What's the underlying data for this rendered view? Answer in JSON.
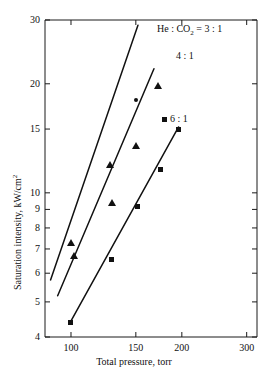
{
  "chart_data": {
    "type": "line",
    "title": "",
    "xlabel": "Total pressure, torr",
    "ylabel": "Saturation intensity, kW/cm²",
    "xscale": "log",
    "yscale": "log",
    "xlim": [
      85,
      320
    ],
    "ylim": [
      4,
      30
    ],
    "grid": false,
    "legend_position": "inline-right-of-lines",
    "xticks": [
      {
        "value": 100,
        "label": "100"
      },
      {
        "value": 150,
        "label": "150"
      },
      {
        "value": 200,
        "label": "200"
      },
      {
        "value": 300,
        "label": "300"
      }
    ],
    "yticks": [
      {
        "value": 4,
        "label": "4"
      },
      {
        "value": 5,
        "label": "5"
      },
      {
        "value": 6,
        "label": "6"
      },
      {
        "value": 7,
        "label": "7"
      },
      {
        "value": 8,
        "label": "8"
      },
      {
        "value": 9,
        "label": "9"
      },
      {
        "value": 10,
        "label": "10"
      },
      {
        "value": 15,
        "label": "15"
      },
      {
        "value": 20,
        "label": "20"
      },
      {
        "value": 30,
        "label": "30"
      }
    ],
    "series": [
      {
        "name": "He : CO2 = 3 : 1",
        "label_html": "He&nbsp;:&nbsp;CO<sub>2</sub>&nbsp;=&nbsp;3&nbsp;:&nbsp;1",
        "label_x": 157,
        "label_y": 24,
        "marker": "triangle",
        "line": [
          [
            88,
            5.75
          ],
          [
            152,
            29.0
          ]
        ],
        "points": [
          {
            "x": 100,
            "y": 7.3,
            "marker": "triangle"
          },
          {
            "x": 128,
            "y": 12.0,
            "marker": "triangle"
          },
          {
            "x": 150,
            "y": 18.0,
            "marker": "dot"
          }
        ]
      },
      {
        "name": "4 : 1",
        "label_html": "4&nbsp;:&nbsp;1",
        "label_x": 176,
        "label_y": 51,
        "marker": "triangle",
        "line": [
          [
            92,
            5.2
          ],
          [
            168,
            22.0
          ]
        ],
        "points": [
          {
            "x": 102,
            "y": 6.7,
            "marker": "triangle"
          },
          {
            "x": 129,
            "y": 9.4,
            "marker": "triangle"
          },
          {
            "x": 150,
            "y": 13.5,
            "marker": "triangle"
          },
          {
            "x": 172,
            "y": 19.8,
            "marker": "triangle"
          }
        ]
      },
      {
        "name": "6 : 1",
        "label_html": "6&nbsp;:&nbsp;1",
        "label_x": 170,
        "label_y": 114,
        "marker": "square",
        "line": [
          [
            99,
            4.35
          ],
          [
            196,
            15.2
          ]
        ],
        "points": [
          {
            "x": 100,
            "y": 4.4,
            "marker": "square"
          },
          {
            "x": 129,
            "y": 6.55,
            "marker": "square"
          },
          {
            "x": 152,
            "y": 9.15,
            "marker": "square"
          },
          {
            "x": 175,
            "y": 11.6,
            "marker": "square"
          },
          {
            "x": 196,
            "y": 15.0,
            "marker": "square"
          }
        ]
      }
    ]
  },
  "axes": {
    "x_title": "Total pressure, torr",
    "y_title_prefix": "Saturation intensity, kW/cm",
    "y_title_sup": "2"
  }
}
